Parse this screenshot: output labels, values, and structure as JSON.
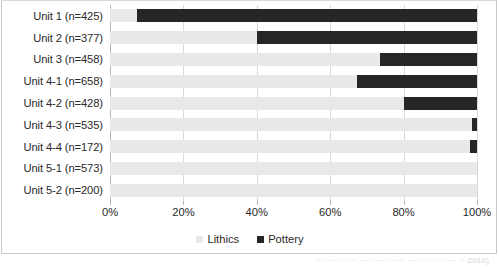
{
  "chart_data": {
    "type": "bar",
    "orientation": "horizontal",
    "stacked": "100%",
    "title": "",
    "xlabel": "",
    "ylabel": "",
    "xlim": [
      0,
      100
    ],
    "grid": true,
    "legend_position": "bottom-center",
    "categories": [
      "Unit 1 (n=425)",
      "Unit 2 (n=377)",
      "Unit 3 (n=458)",
      "Unit 4-1 (n=658)",
      "Unit 4-2 (n=428)",
      "Unit 4-3 (n=535)",
      "Unit 4-4 (n=172)",
      "Unit 5-1 (n=573)",
      "Unit 5-2 (n=200)"
    ],
    "series": [
      {
        "name": "Lithics",
        "color": "#E9E9E9",
        "values": [
          7.4,
          40.0,
          73.6,
          67.3,
          80.1,
          98.6,
          98.0,
          100.0,
          100.0
        ]
      },
      {
        "name": "Pottery",
        "color": "#262626",
        "values": [
          92.6,
          60.0,
          26.4,
          32.7,
          19.9,
          1.4,
          2.0,
          0.0,
          0.0
        ]
      }
    ],
    "xticks": [
      "0%",
      "20%",
      "40%",
      "60%",
      "80%",
      "100%"
    ],
    "xtick_values": [
      0,
      20,
      40,
      60,
      80,
      100
    ]
  },
  "legend": {
    "items": [
      {
        "label": "Lithics",
        "color": "#E9E9E9"
      },
      {
        "label": "Pottery",
        "color": "#262626"
      }
    ]
  },
  "caption_fragment": "·· ···· ·· ···· ····· ···· ····· ··· ···· ·· ·· ··· ·· 2010)"
}
